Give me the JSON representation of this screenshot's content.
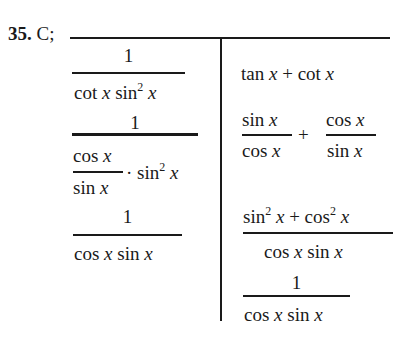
{
  "problem": {
    "number": "35.",
    "answer": "C;"
  },
  "left_column": {
    "step1": {
      "numerator": "1",
      "denominator": [
        "cot",
        "x",
        "sin",
        "2",
        "x"
      ]
    },
    "step2": {
      "numerator": "1",
      "inner_numerator": [
        "cos",
        "x"
      ],
      "inner_denominator": [
        "sin",
        "x"
      ],
      "dot": "·",
      "factor": [
        "sin",
        "2",
        "x"
      ]
    },
    "step3": {
      "numerator": "1",
      "denominator": [
        "cos",
        "x",
        "sin",
        "x"
      ]
    }
  },
  "right_column": {
    "step1": [
      "tan",
      "x",
      "+",
      "cot",
      "x"
    ],
    "step2": {
      "frac1_num": [
        "sin",
        "x"
      ],
      "frac1_den": [
        "cos",
        "x"
      ],
      "plus": "+",
      "frac2_num": [
        "cos",
        "x"
      ],
      "frac2_den": [
        "sin",
        "x"
      ]
    },
    "step3": {
      "numerator": [
        "sin",
        "2",
        "x",
        "+",
        "cos",
        "2",
        "x"
      ],
      "denominator": [
        "cos",
        "x",
        "sin",
        "x"
      ]
    },
    "step4": {
      "numerator": "1",
      "denominator": [
        "cos",
        "x",
        "sin",
        "x"
      ]
    }
  },
  "colors": {
    "ink": "#1a1a1a",
    "background": "#ffffff"
  }
}
